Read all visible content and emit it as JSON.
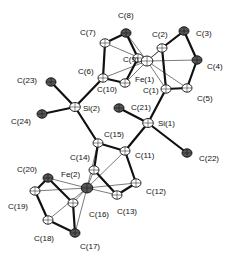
{
  "diagram": {
    "type": "ORTEP crystal structure",
    "atoms": [
      {
        "id": "C8",
        "label": "C(8)",
        "x": 126,
        "y": 33,
        "lx": 118,
        "ly": 18
      },
      {
        "id": "C7",
        "label": "C(7)",
        "x": 105,
        "y": 43,
        "lx": 80,
        "ly": 35
      },
      {
        "id": "C9",
        "label": "C(9)",
        "x": 138,
        "y": 58,
        "lx": 123,
        "ly": 62
      },
      {
        "id": "C6",
        "label": "C(6)",
        "x": 103,
        "y": 78,
        "lx": 78,
        "ly": 74
      },
      {
        "id": "C10",
        "label": "C(10)",
        "x": 125,
        "y": 83,
        "lx": 97,
        "ly": 92
      },
      {
        "id": "Fe1",
        "label": "Fe(1)",
        "x": 147,
        "y": 61,
        "lx": 135,
        "ly": 82
      },
      {
        "id": "C2",
        "label": "C(2)",
        "x": 162,
        "y": 48,
        "lx": 152,
        "ly": 37
      },
      {
        "id": "C3",
        "label": "C(3)",
        "x": 184,
        "y": 31,
        "lx": 196,
        "ly": 36
      },
      {
        "id": "C4",
        "label": "C(4)",
        "x": 197,
        "y": 60,
        "lx": 207,
        "ly": 69
      },
      {
        "id": "C5",
        "label": "C(5)",
        "x": 187,
        "y": 88,
        "lx": 197,
        "ly": 101
      },
      {
        "id": "C1",
        "label": "C(1)",
        "x": 166,
        "y": 89,
        "lx": 143,
        "ly": 93
      },
      {
        "id": "C21",
        "label": "C(21)",
        "x": 119,
        "y": 108,
        "lx": 131,
        "ly": 110
      },
      {
        "id": "Si1",
        "label": "Si(1)",
        "x": 148,
        "y": 123,
        "lx": 158,
        "ly": 126
      },
      {
        "id": "C22",
        "label": "C(22)",
        "x": 187,
        "y": 153,
        "lx": 199,
        "ly": 161
      },
      {
        "id": "C23",
        "label": "C(23)",
        "x": 51,
        "y": 82,
        "lx": 17,
        "ly": 83
      },
      {
        "id": "Si2",
        "label": "Si(2)",
        "x": 75,
        "y": 107,
        "lx": 83,
        "ly": 111
      },
      {
        "id": "C24",
        "label": "C(24)",
        "x": 42,
        "y": 114,
        "lx": 11,
        "ly": 124
      },
      {
        "id": "C15",
        "label": "C(15)",
        "x": 98,
        "y": 143,
        "lx": 104,
        "ly": 137
      },
      {
        "id": "C11",
        "label": "C(11)",
        "x": 125,
        "y": 151,
        "lx": 135,
        "ly": 158
      },
      {
        "id": "C14",
        "label": "C(14)",
        "x": 94,
        "y": 170,
        "lx": 70,
        "ly": 160
      },
      {
        "id": "Fe2",
        "label": "Fe(2)",
        "x": 87,
        "y": 188,
        "lx": 61,
        "ly": 177
      },
      {
        "id": "C12",
        "label": "C(12)",
        "x": 136,
        "y": 183,
        "lx": 146,
        "ly": 194
      },
      {
        "id": "C13",
        "label": "C(13)",
        "x": 117,
        "y": 195,
        "lx": 117,
        "ly": 214
      },
      {
        "id": "C20",
        "label": "C(20)",
        "x": 48,
        "y": 178,
        "lx": 17,
        "ly": 172
      },
      {
        "id": "C19",
        "label": "C(19)",
        "x": 35,
        "y": 191,
        "lx": 8,
        "ly": 209
      },
      {
        "id": "C16",
        "label": "C(16)",
        "x": 73,
        "y": 203,
        "lx": 89,
        "ly": 217
      },
      {
        "id": "C18",
        "label": "C(18)",
        "x": 48,
        "y": 220,
        "lx": 34,
        "ly": 241
      },
      {
        "id": "C17",
        "label": "C(17)",
        "x": 75,
        "y": 233,
        "lx": 80,
        "ly": 249
      }
    ],
    "bonds": [
      [
        "C6",
        "C7"
      ],
      [
        "C7",
        "C8"
      ],
      [
        "C8",
        "C9"
      ],
      [
        "C9",
        "C10"
      ],
      [
        "C10",
        "C6"
      ],
      [
        "C1",
        "C2"
      ],
      [
        "C2",
        "C3"
      ],
      [
        "C3",
        "C4"
      ],
      [
        "C4",
        "C5"
      ],
      [
        "C5",
        "C1"
      ],
      [
        "C6",
        "Si2"
      ],
      [
        "Si2",
        "C23"
      ],
      [
        "Si2",
        "C24"
      ],
      [
        "Si2",
        "C15"
      ],
      [
        "C1",
        "Si1"
      ],
      [
        "Si1",
        "C21"
      ],
      [
        "Si1",
        "C22"
      ],
      [
        "Si1",
        "C11"
      ],
      [
        "C15",
        "C11"
      ],
      [
        "C15",
        "C14"
      ],
      [
        "C11",
        "C12"
      ],
      [
        "C12",
        "C13"
      ],
      [
        "C13",
        "C14"
      ],
      [
        "C16",
        "C17"
      ],
      [
        "C17",
        "C18"
      ],
      [
        "C18",
        "C19"
      ],
      [
        "C19",
        "C20"
      ],
      [
        "C20",
        "C16"
      ]
    ],
    "fe_contacts": [
      [
        "Fe1",
        "C6"
      ],
      [
        "Fe1",
        "C7"
      ],
      [
        "Fe1",
        "C8"
      ],
      [
        "Fe1",
        "C9"
      ],
      [
        "Fe1",
        "C10"
      ],
      [
        "Fe1",
        "C1"
      ],
      [
        "Fe1",
        "C2"
      ],
      [
        "Fe1",
        "C3"
      ],
      [
        "Fe1",
        "C4"
      ],
      [
        "Fe1",
        "C5"
      ],
      [
        "Fe2",
        "C11"
      ],
      [
        "Fe2",
        "C12"
      ],
      [
        "Fe2",
        "C13"
      ],
      [
        "Fe2",
        "C14"
      ],
      [
        "Fe2",
        "C15"
      ],
      [
        "Fe2",
        "C16"
      ],
      [
        "Fe2",
        "C17"
      ],
      [
        "Fe2",
        "C18"
      ],
      [
        "Fe2",
        "C19"
      ],
      [
        "Fe2",
        "C20"
      ]
    ],
    "dark_atoms": [
      "C8",
      "C3",
      "C23",
      "C24",
      "C22",
      "C20",
      "C17",
      "C21",
      "C4",
      "Fe2"
    ]
  }
}
